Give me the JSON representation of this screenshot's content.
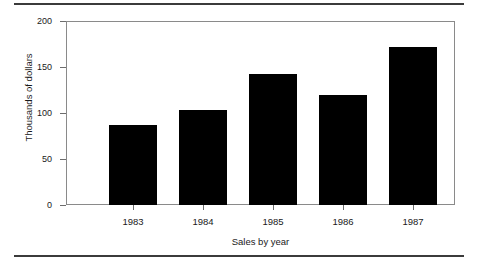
{
  "chart_data": {
    "type": "bar",
    "title": "",
    "subtitle": "",
    "xlabel": "Sales by year",
    "ylabel": "Thousands of dollars",
    "categories": [
      "1983",
      "1984",
      "1985",
      "1986",
      "1987"
    ],
    "values": [
      87,
      103,
      142,
      120,
      172
    ],
    "series": [
      {
        "name": "Sales",
        "values": [
          87,
          103,
          142,
          120,
          172
        ]
      }
    ],
    "ylim": [
      0,
      200
    ],
    "yticks": [
      0,
      50,
      100,
      150,
      200
    ],
    "ytick_labels": [
      "0",
      "50",
      "100",
      "150",
      "200"
    ],
    "grid": false,
    "legend": false,
    "legend_position": "none",
    "bar_color": "#000000",
    "frame_color": "#8a8a8a",
    "background_color": "#ffffff"
  },
  "figure": {
    "rule_color": "#3b3b3b"
  }
}
